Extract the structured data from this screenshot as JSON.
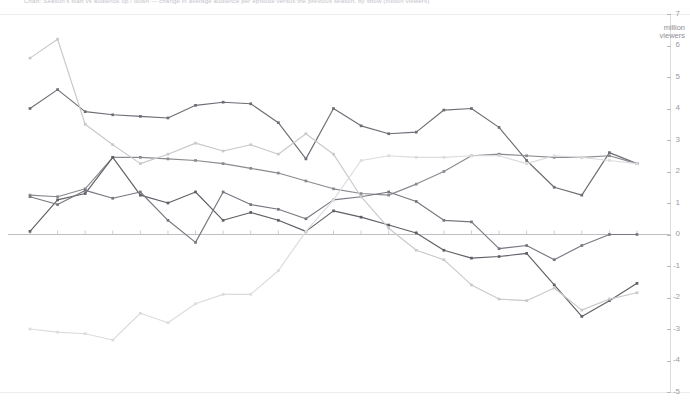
{
  "header": {
    "title": "Chart: Season's start vs audience up / down — change in average audience per episode versus the previous season, by show (million viewers)"
  },
  "axis": {
    "unit_line1": "million",
    "unit_line2": "viewers",
    "y_ticks": [
      7,
      6,
      5,
      4,
      3,
      2,
      1,
      0,
      -1,
      -2,
      -3,
      -4,
      -5
    ]
  },
  "colors": {
    "series1": "#6d6d75",
    "series2": "#8a8a90",
    "series3": "#5f5f66",
    "series4": "#777780",
    "series5": "#c9c9cc",
    "series6": "#dcdcdf",
    "axis": "#b9b9bd",
    "rule": "#ececed",
    "tick_text": "#9a9aa0"
  },
  "chart_data": {
    "type": "line",
    "xlabel": "",
    "ylabel": "million viewers",
    "ylim": [
      -5,
      7
    ],
    "xlim": [
      0,
      22
    ],
    "grid": false,
    "legend": "none",
    "markers": true,
    "x": [
      0,
      1,
      2,
      3,
      4,
      5,
      6,
      7,
      8,
      9,
      10,
      11,
      12,
      13,
      14,
      15,
      16,
      17,
      18,
      19,
      20,
      21,
      22
    ],
    "series": [
      {
        "name": "Series A (dark grey, upper band)",
        "color": "#6d6d75",
        "values": [
          4.0,
          4.6,
          3.9,
          3.8,
          3.75,
          3.7,
          4.1,
          4.2,
          4.15,
          3.55,
          2.4,
          4.0,
          3.45,
          3.2,
          3.25,
          3.95,
          4.0,
          3.4,
          2.35,
          1.5,
          1.25,
          2.6,
          2.25
        ]
      },
      {
        "name": "Series B (mid grey, rising)",
        "color": "#8a8a90",
        "values": [
          1.25,
          1.2,
          1.45,
          2.45,
          2.45,
          2.4,
          2.35,
          2.25,
          2.1,
          1.95,
          1.7,
          1.45,
          1.3,
          1.25,
          1.6,
          2.0,
          2.5,
          2.55,
          2.5,
          2.45,
          2.45,
          2.5,
          2.25
        ]
      },
      {
        "name": "Series C (dark grey, descending to negative)",
        "color": "#5f5f66",
        "values": [
          0.1,
          1.1,
          1.3,
          2.45,
          1.25,
          1.0,
          1.35,
          0.45,
          0.7,
          0.45,
          0.1,
          0.75,
          0.55,
          0.3,
          0.05,
          -0.5,
          -0.75,
          -0.7,
          -0.6,
          -1.6,
          -2.6,
          -2.1,
          -1.55
        ]
      },
      {
        "name": "Series D (grey, mid oscillating)",
        "color": "#777780",
        "values": [
          1.2,
          0.95,
          1.4,
          1.15,
          1.35,
          0.45,
          -0.25,
          1.35,
          0.95,
          0.8,
          0.5,
          1.1,
          1.2,
          1.35,
          1.05,
          0.45,
          0.4,
          -0.45,
          -0.35,
          -0.8,
          -0.35,
          0.0,
          0.0
        ]
      },
      {
        "name": "Series E (light grey, falling from high)",
        "color": "#c9c9cc",
        "values": [
          5.6,
          6.2,
          3.5,
          2.85,
          2.25,
          2.55,
          2.9,
          2.65,
          2.85,
          2.55,
          3.2,
          2.55,
          1.2,
          0.2,
          -0.5,
          -0.8,
          -1.6,
          -2.05,
          -2.1,
          -1.7,
          -2.4,
          -2.05,
          -1.85
        ]
      },
      {
        "name": "Series F (pale grey, rising from low then falling)",
        "color": "#dcdcdf",
        "values": [
          -3.0,
          -3.1,
          -3.15,
          -3.35,
          -2.5,
          -2.8,
          -2.2,
          -1.9,
          -1.9,
          -1.15,
          0.1,
          1.1,
          2.35,
          2.5,
          2.45,
          2.45,
          2.5,
          2.5,
          2.25,
          2.5,
          2.45,
          2.35,
          2.25
        ]
      }
    ]
  }
}
